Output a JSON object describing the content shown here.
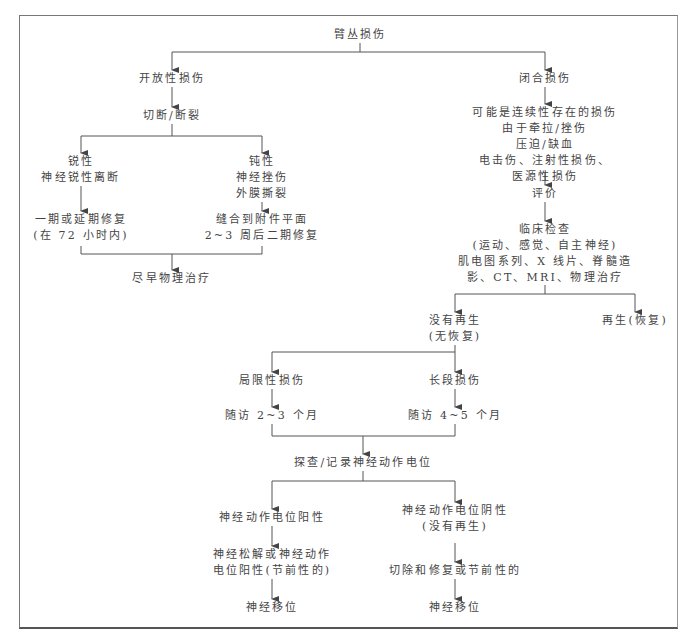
{
  "diagram": {
    "type": "flowchart",
    "colors": {
      "line": "#555555",
      "text": "#444444",
      "frame": "#777777"
    },
    "root": {
      "lines": [
        "臂丛损伤"
      ]
    },
    "open_branch": {
      "title": {
        "lines": [
          "开放性损伤"
        ]
      },
      "cut": {
        "lines": [
          "切断/断裂"
        ]
      },
      "sharp": {
        "lines": [
          "锐性",
          "神经锐性离断"
        ]
      },
      "sharp_repair": {
        "lines": [
          "一期或延期修复",
          "(在 72 小时内)"
        ]
      },
      "blunt": {
        "lines": [
          "钝性",
          "神经挫伤",
          "外膜撕裂"
        ]
      },
      "blunt_repair": {
        "lines": [
          "缝合到附件平面",
          "2~3 周后二期修复"
        ]
      },
      "pt": {
        "lines": [
          "尽早物理治疗"
        ]
      }
    },
    "closed_branch": {
      "title": {
        "lines": [
          "闭合损伤"
        ]
      },
      "causes": {
        "lines": [
          "可能是连续性存在的损伤",
          "由于牵拉/挫伤",
          "压迫/缺血",
          "电击伤、注射性损伤、",
          "医源性损伤"
        ]
      },
      "evaluate": {
        "lines": [
          "评价"
        ]
      },
      "exam": {
        "lines": [
          "临床检查",
          "(运动、感觉、自主神经)",
          "肌电图系列、X 线片、脊髓造",
          "影、CT、MRI、物理治疗"
        ]
      },
      "no_regen": {
        "lines": [
          "没有再生",
          "(无恢复)"
        ]
      },
      "regen": {
        "lines": [
          "再生(恢复)"
        ]
      },
      "local": {
        "lines": [
          "局限性损伤"
        ]
      },
      "long": {
        "lines": [
          "长段损伤"
        ]
      },
      "follow_local": {
        "lines": [
          "随访 2~3 个月"
        ]
      },
      "follow_long": {
        "lines": [
          "随访 4~5 个月"
        ]
      },
      "explore": {
        "lines": [
          "探查/记录神经动作电位"
        ]
      },
      "nap_pos": {
        "lines": [
          "神经动作电位阳性"
        ]
      },
      "nap_neg": {
        "lines": [
          "神经动作电位阴性",
          "(没有再生)"
        ]
      },
      "neurolysis": {
        "lines": [
          "神经松解或神经动作",
          "电位阳性(节前性的)"
        ]
      },
      "resect": {
        "lines": [
          "切除和修复或节前性的"
        ]
      },
      "transfer_left": {
        "lines": [
          "神经移位"
        ]
      },
      "transfer_right": {
        "lines": [
          "神经移位"
        ]
      }
    }
  }
}
